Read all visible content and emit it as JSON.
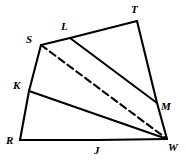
{
  "figure": {
    "name": "quadrilateral-with-cevians",
    "width": 186,
    "height": 162,
    "background_color": "#ffffff",
    "stroke_color": "#000000",
    "stroke_width": 2.1,
    "dash_pattern": "7 4"
  },
  "points": {
    "S": {
      "label": "S",
      "x": 41,
      "y": 45,
      "label_x": 26,
      "label_y": 34
    },
    "L": {
      "label": "L",
      "x": 70,
      "y": 38,
      "label_x": 61,
      "label_y": 21
    },
    "T": {
      "label": "T",
      "x": 137,
      "y": 21,
      "label_x": 131,
      "label_y": 4
    },
    "M": {
      "label": "M",
      "x": 157,
      "y": 103,
      "label_x": 161,
      "label_y": 101
    },
    "W": {
      "label": "W",
      "x": 167,
      "y": 139,
      "label_x": 168,
      "label_y": 142
    },
    "J": {
      "label": "J",
      "x": 98,
      "y": 140,
      "label_x": 94,
      "label_y": 145
    },
    "R": {
      "label": "R",
      "x": 20,
      "y": 140,
      "label_x": 6,
      "label_y": 135
    },
    "K": {
      "label": "K",
      "x": 29,
      "y": 91,
      "label_x": 13,
      "label_y": 80
    }
  },
  "segments": [
    {
      "name": "segment-S-L",
      "from": "S",
      "to": "L",
      "style": "solid"
    },
    {
      "name": "segment-L-T",
      "from": "L",
      "to": "T",
      "style": "solid"
    },
    {
      "name": "segment-T-M",
      "from": "T",
      "to": "M",
      "style": "solid"
    },
    {
      "name": "segment-M-W",
      "from": "M",
      "to": "W",
      "style": "solid"
    },
    {
      "name": "segment-W-J",
      "from": "W",
      "to": "J",
      "style": "solid"
    },
    {
      "name": "segment-J-R",
      "from": "J",
      "to": "R",
      "style": "solid"
    },
    {
      "name": "segment-R-K",
      "from": "R",
      "to": "K",
      "style": "solid"
    },
    {
      "name": "segment-K-S",
      "from": "K",
      "to": "S",
      "style": "solid"
    },
    {
      "name": "segment-L-M",
      "from": "L",
      "to": "M",
      "style": "solid"
    },
    {
      "name": "segment-K-W",
      "from": "K",
      "to": "W",
      "style": "solid"
    },
    {
      "name": "segment-S-W",
      "from": "S",
      "to": "W",
      "style": "dashed"
    }
  ]
}
